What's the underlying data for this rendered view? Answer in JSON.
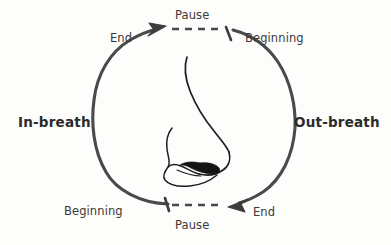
{
  "diagram": {
    "type": "breathing-cycle-circle",
    "background_color": "#fdfdfc",
    "stroke_color": "#4a4a4a",
    "text_color": "#3a3a3a",
    "bold_text_color": "#2b2b2b",
    "center_illustration": "nose-profile-line-drawing",
    "labels": {
      "pause_top": "Pause",
      "pause_bottom": "Pause",
      "end_top": "End",
      "beginning_top": "Beginning",
      "in_breath": "In-breath",
      "out_breath": "Out-breath",
      "beginning_bottom": "Beginning",
      "end_bottom": "End"
    }
  }
}
